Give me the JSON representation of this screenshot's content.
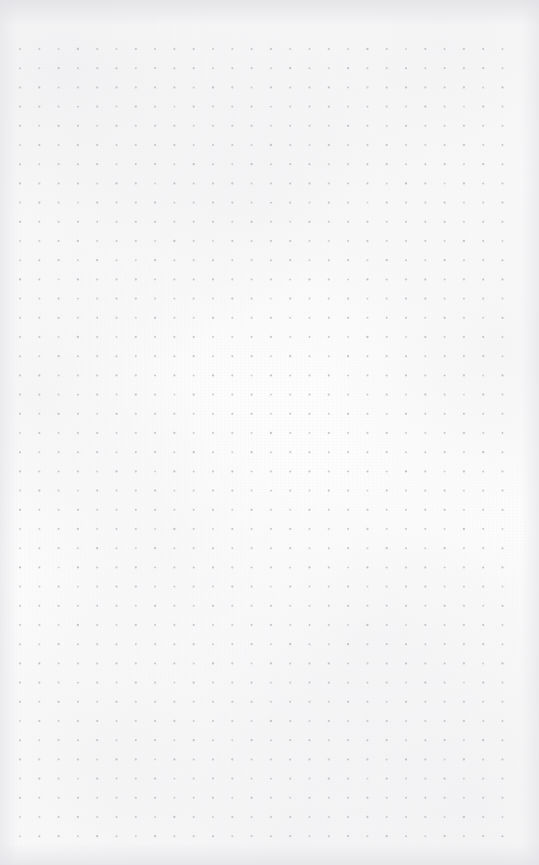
{
  "document": {
    "type": "dot-grid-paper-scan",
    "title": "Blank dot grid notebook page",
    "orientation": "portrait",
    "page_width_px": 539,
    "page_height_px": 865,
    "has_text": false,
    "has_handwriting": false,
    "visible_text": ""
  },
  "colors": {
    "paper_background": "#fdfdfd",
    "dot_color": "#b9b9be",
    "edge_shadow": "#e4e4e8"
  },
  "grid": {
    "pattern": "dot-grid",
    "columns": 26,
    "rows": 42,
    "origin_x_px": 20,
    "origin_y_px": 49,
    "spacing_x_px": 19.3,
    "spacing_y_px": 19.2,
    "dot_radius_px": 0.95,
    "dot_opacity": 0.85,
    "margin_left_px": 20,
    "margin_top_px": 49,
    "margin_right_px": 37,
    "margin_bottom_px": 19
  },
  "annotations": {
    "content_note": "No text, labels, icons, or drawn marks are present — the page is entirely blank ruled dot paper.",
    "texture_note": "Faint paper grain with slightly darker tone along all four scan edges."
  }
}
